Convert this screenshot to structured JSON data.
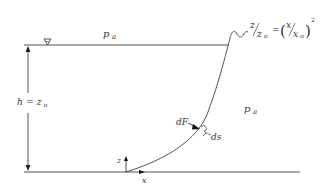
{
  "diagram": {
    "title_equation": {
      "lhs_num": "z",
      "lhs_den": "z",
      "lhs_den_sub": "o",
      "equals": "=",
      "rhs_open": "(",
      "rhs_num": "x",
      "rhs_den": "x",
      "rhs_den_sub": "o",
      "rhs_close": ")",
      "exponent": "2"
    },
    "labels": {
      "pressure_top": "p",
      "pressure_top_sub": "a",
      "pressure_right": "p",
      "pressure_right_sub": "a",
      "depth_h": "h",
      "depth_eq": "=",
      "depth_z": "z",
      "depth_z_sub": "o",
      "force": "dF",
      "arc_element": "ds",
      "axis_z": "z",
      "axis_x": "x",
      "free_surface_symbol": "∇"
    },
    "colors": {
      "stroke": "#555555",
      "text": "#333333",
      "background": "#ffffff"
    }
  }
}
